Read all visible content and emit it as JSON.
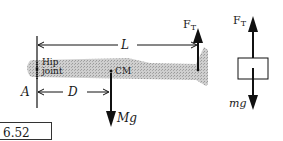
{
  "diagram": {
    "leg": {
      "hip_label_line1": "Hip",
      "hip_label_line2": "joint",
      "cm_label": "CM",
      "point_a_label": "A",
      "length_label": "L",
      "distance_label": "D",
      "weight_label": "Mg",
      "tension_label": "F",
      "tension_subscript": "T",
      "fill_color": "#bdbdbd"
    },
    "block": {
      "tension_label": "F",
      "tension_subscript": "T",
      "weight_label": "mg"
    }
  },
  "answer": {
    "value": "6.52 kg."
  }
}
